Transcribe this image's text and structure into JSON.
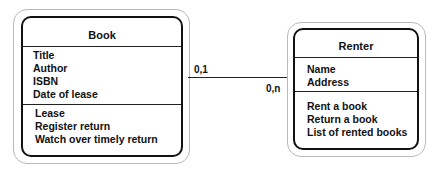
{
  "diagram": {
    "type": "uml-class-association",
    "classes": [
      {
        "name": "Book",
        "attributes": [
          "Title",
          "Author",
          "ISBN",
          "Date of lease"
        ],
        "operations": [
          "Lease",
          "Register return",
          "Watch over timely return"
        ]
      },
      {
        "name": "Renter",
        "attributes": [
          "Name",
          "Address"
        ],
        "operations": [
          "Rent a book",
          "Return a book",
          "List of rented books"
        ]
      }
    ],
    "association": {
      "from": "Book",
      "to": "Renter",
      "from_multiplicity": "0,1",
      "to_multiplicity": "0,n"
    }
  }
}
